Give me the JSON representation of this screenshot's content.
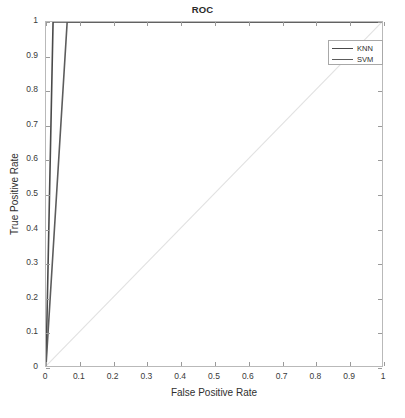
{
  "chart_data": {
    "type": "line",
    "title": "ROC",
    "xlabel": "False Positive Rate",
    "ylabel": "True Positive Rate",
    "xlim": [
      0,
      1
    ],
    "ylim": [
      0,
      1
    ],
    "xticks": [
      "0",
      "0.1",
      "0.2",
      "0.3",
      "0.4",
      "0.5",
      "0.6",
      "0.7",
      "0.8",
      "0.9",
      "1"
    ],
    "xtick_values": [
      0,
      0.1,
      0.2,
      0.3,
      0.4,
      0.5,
      0.6,
      0.7,
      0.8,
      0.9,
      1
    ],
    "yticks": [
      "0",
      "0.1",
      "0.2",
      "0.3",
      "0.4",
      "0.5",
      "0.6",
      "0.7",
      "0.8",
      "0.9",
      "1"
    ],
    "ytick_values": [
      0,
      0.1,
      0.2,
      0.3,
      0.4,
      0.5,
      0.6,
      0.7,
      0.8,
      0.9,
      1
    ],
    "grid": false,
    "legend_position": "upper right",
    "series": [
      {
        "name": "KNN",
        "color": "#4a4a4a",
        "linewidth": 1.6,
        "x": [
          0,
          0.021,
          1
        ],
        "y": [
          0,
          1,
          1
        ]
      },
      {
        "name": "SVM",
        "color": "#5c5c5c",
        "linewidth": 1.6,
        "x": [
          0,
          0.063,
          1
        ],
        "y": [
          0,
          1,
          1
        ]
      }
    ],
    "reference_line": {
      "name": "chance-diagonal",
      "color": "#e2e2e2",
      "linewidth": 1.2,
      "x": [
        0,
        1
      ],
      "y": [
        0,
        1
      ]
    }
  },
  "legend": {
    "entries": [
      {
        "label": "KNN",
        "color": "#4a4a4a"
      },
      {
        "label": "SVM",
        "color": "#5c5c5c"
      }
    ]
  },
  "axes": {
    "box_color": "#b9b9b9",
    "tick_color": "#9a9a9a",
    "text_color": "#3a3a3a"
  }
}
